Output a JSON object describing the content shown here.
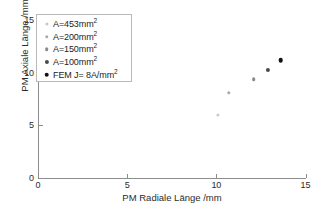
{
  "chart_data": {
    "type": "scatter",
    "title": "",
    "xlabel": "PM Radiale Länge /mm",
    "ylabel": "PM Axiale Länge /mm",
    "xlim": [
      0,
      15
    ],
    "ylim": [
      0,
      15
    ],
    "xticks": [
      0,
      5,
      10,
      15
    ],
    "yticks": [
      0,
      5,
      10,
      15
    ],
    "xticklabels": [
      "0",
      "5",
      "10",
      "15"
    ],
    "yticklabels": [
      "0",
      "5",
      "10",
      "15"
    ],
    "grid": false,
    "legend_position": "upper-left",
    "series": [
      {
        "name": "A=453mm²",
        "name_base": "A=453mm",
        "name_sup": "2",
        "marker_color": "#c9c9c9",
        "marker_size": 3.2,
        "x": [
          10.1
        ],
        "y": [
          6.0
        ]
      },
      {
        "name": "A=200mm²",
        "name_base": "A=200mm",
        "name_sup": "2",
        "marker_color": "#a8a8a8",
        "marker_size": 3.4,
        "x": [
          10.7
        ],
        "y": [
          8.1
        ]
      },
      {
        "name": "A=150mm²",
        "name_base": "A=150mm",
        "name_sup": "2",
        "marker_color": "#8a8a8a",
        "marker_size": 3.6,
        "x": [
          12.1
        ],
        "y": [
          9.4
        ]
      },
      {
        "name": "A=100mm²",
        "name_base": "A=100mm",
        "name_sup": "2",
        "marker_color": "#4a4a4a",
        "marker_size": 4.2,
        "x": [
          12.9
        ],
        "y": [
          10.3
        ]
      },
      {
        "name": "FEM J= 8A/mm²",
        "name_base": "FEM J= 8A/mm",
        "name_sup": "2",
        "marker_color": "#111111",
        "marker_size": 4.6,
        "x": [
          13.6
        ],
        "y": [
          11.2
        ]
      }
    ]
  },
  "axes": {
    "x_title": "PM Radiale Länge /mm",
    "y_title": "PM Axiale Länge /mm",
    "axis_color": "#8d8d8d"
  }
}
